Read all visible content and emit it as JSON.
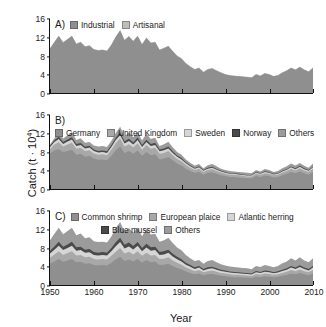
{
  "figure": {
    "ylabel_prefix": "Catch (t · 10",
    "ylabel_exponent": "4",
    "ylabel_suffix": ")",
    "xlabel": "Year"
  },
  "axes": {
    "yticks": [
      0,
      4,
      8,
      12,
      16
    ],
    "xticks": [
      1950,
      1960,
      1970,
      1980,
      1990,
      2000,
      2010
    ],
    "ylim": [
      0,
      16
    ],
    "xlim": [
      1950,
      2010
    ]
  },
  "colors": {
    "s1": "#8f8f8f",
    "s2": "#bdbdbd",
    "s3": "#d6d6d6",
    "s4": "#4a4a4a",
    "s5": "#a8a8a8",
    "axis": "#111111",
    "background": "#ffffff"
  },
  "panels": [
    {
      "id": "A",
      "label": "A)",
      "legend": [
        "Industrial",
        "Artisanal"
      ]
    },
    {
      "id": "B",
      "label": "B)",
      "legend": [
        "Germany",
        "United Kingdom",
        "Sweden",
        "Norway",
        "Others"
      ]
    },
    {
      "id": "C",
      "label": "C)",
      "legend": [
        "Common shrimp",
        "European plaice",
        "Atlantic herring",
        "Blue mussel",
        "Others"
      ]
    }
  ],
  "chart_data": [
    {
      "type": "area",
      "panel": "A",
      "title": "A)",
      "xlabel": "Year",
      "ylabel": "Catch (t · 10^4)",
      "xlim": [
        1950,
        2010
      ],
      "ylim": [
        0,
        16
      ],
      "grid": false,
      "legend_position": "top-left",
      "stacked": true,
      "x": [
        1950,
        1951,
        1952,
        1953,
        1954,
        1955,
        1956,
        1957,
        1958,
        1959,
        1960,
        1961,
        1962,
        1963,
        1964,
        1965,
        1966,
        1967,
        1968,
        1969,
        1970,
        1971,
        1972,
        1973,
        1974,
        1975,
        1976,
        1977,
        1978,
        1979,
        1980,
        1981,
        1982,
        1983,
        1984,
        1985,
        1986,
        1987,
        1988,
        1989,
        1990,
        1991,
        1992,
        1993,
        1994,
        1995,
        1996,
        1997,
        1998,
        1999,
        2000,
        2001,
        2002,
        2003,
        2004,
        2005,
        2006,
        2007,
        2008,
        2009,
        2010
      ],
      "series": [
        {
          "name": "Industrial",
          "values": [
            9.6,
            11.0,
            12.3,
            10.9,
            11.6,
            12.3,
            10.6,
            11.0,
            10.0,
            10.2,
            9.4,
            9.2,
            9.3,
            9.1,
            10.4,
            12.1,
            13.5,
            11.4,
            12.2,
            11.2,
            12.3,
            10.5,
            11.9,
            10.8,
            11.0,
            9.3,
            9.7,
            10.1,
            9.0,
            8.0,
            7.4,
            6.4,
            5.7,
            5.1,
            5.4,
            4.5,
            5.1,
            5.3,
            4.8,
            4.4,
            4.0,
            3.8,
            3.7,
            3.6,
            3.5,
            3.4,
            3.3,
            4.0,
            3.7,
            4.2,
            4.0,
            3.6,
            3.8,
            4.4,
            4.8,
            5.4,
            5.0,
            5.6,
            5.0,
            4.6,
            5.4
          ]
        },
        {
          "name": "Artisanal",
          "values": [
            0.1,
            0.1,
            0.1,
            0.1,
            0.1,
            0.1,
            0.1,
            0.1,
            0.1,
            0.1,
            0.1,
            0.1,
            0.1,
            0.1,
            0.1,
            0.1,
            0.1,
            0.1,
            0.1,
            0.1,
            0.1,
            0.1,
            0.1,
            0.1,
            0.1,
            0.1,
            0.1,
            0.1,
            0.1,
            0.1,
            0.1,
            0.1,
            0.1,
            0.1,
            0.1,
            0.1,
            0.1,
            0.1,
            0.1,
            0.1,
            0.1,
            0.1,
            0.1,
            0.1,
            0.1,
            0.1,
            0.1,
            0.1,
            0.1,
            0.1,
            0.1,
            0.1,
            0.1,
            0.1,
            0.1,
            0.1,
            0.1,
            0.1,
            0.1,
            0.1,
            0.1
          ]
        }
      ]
    },
    {
      "type": "area",
      "panel": "B",
      "title": "B)",
      "xlabel": "Year",
      "ylabel": "Catch (t · 10^4)",
      "xlim": [
        1950,
        2010
      ],
      "ylim": [
        0,
        16
      ],
      "grid": false,
      "legend_position": "top-left",
      "stacked": true,
      "x": [
        1950,
        1951,
        1952,
        1953,
        1954,
        1955,
        1956,
        1957,
        1958,
        1959,
        1960,
        1961,
        1962,
        1963,
        1964,
        1965,
        1966,
        1967,
        1968,
        1969,
        1970,
        1971,
        1972,
        1973,
        1974,
        1975,
        1976,
        1977,
        1978,
        1979,
        1980,
        1981,
        1982,
        1983,
        1984,
        1985,
        1986,
        1987,
        1988,
        1989,
        1990,
        1991,
        1992,
        1993,
        1994,
        1995,
        1996,
        1997,
        1998,
        1999,
        2000,
        2001,
        2002,
        2003,
        2004,
        2005,
        2006,
        2007,
        2008,
        2009,
        2010
      ],
      "series": [
        {
          "name": "Germany",
          "values": [
            7.6,
            8.4,
            8.6,
            8.0,
            8.2,
            8.5,
            7.4,
            7.6,
            7.0,
            7.2,
            6.6,
            6.3,
            6.4,
            6.2,
            7.2,
            8.4,
            9.2,
            7.8,
            8.2,
            7.6,
            8.3,
            7.2,
            8.0,
            7.3,
            7.5,
            6.4,
            6.6,
            6.9,
            6.2,
            5.5,
            5.1,
            4.4,
            3.9,
            3.5,
            3.7,
            3.1,
            3.5,
            3.6,
            3.3,
            3.0,
            2.8,
            2.6,
            2.6,
            2.5,
            2.4,
            2.3,
            2.3,
            2.8,
            2.6,
            2.9,
            2.8,
            2.5,
            2.6,
            3.0,
            3.3,
            3.7,
            3.4,
            3.8,
            3.4,
            3.1,
            3.7
          ]
        },
        {
          "name": "United Kingdom",
          "values": [
            1.0,
            1.2,
            1.5,
            1.2,
            1.4,
            1.5,
            1.3,
            1.3,
            1.2,
            1.2,
            1.1,
            1.1,
            1.1,
            1.1,
            1.3,
            1.5,
            1.7,
            1.4,
            1.5,
            1.4,
            1.6,
            1.3,
            1.5,
            1.4,
            1.4,
            1.2,
            1.2,
            1.3,
            1.1,
            1.0,
            0.9,
            0.8,
            0.7,
            0.6,
            0.7,
            0.6,
            0.6,
            0.7,
            0.6,
            0.55,
            0.5,
            0.48,
            0.47,
            0.45,
            0.44,
            0.42,
            0.42,
            0.5,
            0.47,
            0.53,
            0.5,
            0.45,
            0.48,
            0.55,
            0.6,
            0.68,
            0.62,
            0.7,
            0.62,
            0.57,
            0.68
          ]
        },
        {
          "name": "Sweden",
          "values": [
            0.45,
            0.55,
            0.7,
            0.55,
            0.65,
            0.7,
            0.6,
            0.6,
            0.55,
            0.55,
            0.5,
            0.5,
            0.5,
            0.5,
            0.6,
            0.7,
            0.8,
            0.65,
            0.7,
            0.62,
            0.72,
            0.6,
            0.68,
            0.62,
            0.64,
            0.55,
            0.56,
            0.58,
            0.5,
            0.45,
            0.4,
            0.35,
            0.3,
            0.27,
            0.3,
            0.25,
            0.28,
            0.3,
            0.26,
            0.24,
            0.22,
            0.21,
            0.2,
            0.2,
            0.19,
            0.18,
            0.18,
            0.22,
            0.2,
            0.23,
            0.22,
            0.2,
            0.21,
            0.24,
            0.26,
            0.3,
            0.27,
            0.3,
            0.27,
            0.25,
            0.3
          ]
        },
        {
          "name": "Norway",
          "values": [
            0.3,
            0.4,
            0.5,
            0.4,
            0.45,
            0.5,
            0.42,
            0.42,
            0.38,
            0.38,
            0.35,
            0.34,
            0.34,
            0.34,
            0.4,
            0.5,
            0.55,
            0.45,
            0.48,
            0.43,
            0.5,
            0.42,
            0.47,
            0.43,
            0.44,
            0.38,
            0.38,
            0.4,
            0.35,
            0.3,
            0.28,
            0.24,
            0.21,
            0.19,
            0.2,
            0.17,
            0.19,
            0.2,
            0.18,
            0.16,
            0.15,
            0.14,
            0.14,
            0.13,
            0.13,
            0.12,
            0.12,
            0.15,
            0.14,
            0.16,
            0.15,
            0.14,
            0.14,
            0.16,
            0.18,
            0.2,
            0.18,
            0.2,
            0.18,
            0.17,
            0.2
          ]
        },
        {
          "name": "Others",
          "values": [
            0.25,
            0.45,
            1.0,
            0.75,
            0.9,
            1.1,
            0.85,
            1.05,
            0.87,
            0.85,
            0.84,
            0.95,
            0.96,
            0.96,
            0.9,
            1.0,
            1.23,
            1.1,
            1.32,
            1.15,
            1.22,
            0.98,
            1.3,
            1.05,
            1.08,
            0.77,
            0.96,
            1.02,
            0.85,
            0.75,
            0.71,
            0.61,
            0.59,
            0.54,
            0.53,
            0.38,
            0.58,
            0.6,
            0.56,
            0.45,
            0.43,
            0.47,
            0.39,
            0.42,
            0.44,
            0.48,
            0.38,
            0.43,
            0.39,
            0.48,
            0.43,
            0.41,
            0.47,
            0.55,
            0.56,
            0.62,
            0.59,
            0.6,
            0.53,
            0.51,
            0.62
          ]
        }
      ]
    },
    {
      "type": "area",
      "panel": "C",
      "title": "C)",
      "xlabel": "Year",
      "ylabel": "Catch (t · 10^4)",
      "xlim": [
        1950,
        2010
      ],
      "ylim": [
        0,
        16
      ],
      "grid": false,
      "legend_position": "top-left",
      "stacked": true,
      "x": [
        1950,
        1951,
        1952,
        1953,
        1954,
        1955,
        1956,
        1957,
        1958,
        1959,
        1960,
        1961,
        1962,
        1963,
        1964,
        1965,
        1966,
        1967,
        1968,
        1969,
        1970,
        1971,
        1972,
        1973,
        1974,
        1975,
        1976,
        1977,
        1978,
        1979,
        1980,
        1981,
        1982,
        1983,
        1984,
        1985,
        1986,
        1987,
        1988,
        1989,
        1990,
        1991,
        1992,
        1993,
        1994,
        1995,
        1996,
        1997,
        1998,
        1999,
        2000,
        2001,
        2002,
        2003,
        2004,
        2005,
        2006,
        2007,
        2008,
        2009,
        2010
      ],
      "series": [
        {
          "name": "Common shrimp",
          "values": [
            4.6,
            5.1,
            5.6,
            5.0,
            5.3,
            5.6,
            4.9,
            5.0,
            4.6,
            4.7,
            4.3,
            4.2,
            4.3,
            4.2,
            4.8,
            5.5,
            6.1,
            5.2,
            5.5,
            5.1,
            5.6,
            4.8,
            5.4,
            4.9,
            5.0,
            4.3,
            4.4,
            4.6,
            4.1,
            3.7,
            3.4,
            2.9,
            2.6,
            2.3,
            2.5,
            2.1,
            2.3,
            2.4,
            2.2,
            2.0,
            1.9,
            1.8,
            1.7,
            1.7,
            1.6,
            1.6,
            1.5,
            1.8,
            1.7,
            1.9,
            1.8,
            1.7,
            1.8,
            2.0,
            2.2,
            2.5,
            2.3,
            2.6,
            2.3,
            2.1,
            2.5
          ]
        },
        {
          "name": "European plaice",
          "values": [
            1.3,
            1.5,
            1.7,
            1.5,
            1.6,
            1.7,
            1.5,
            1.5,
            1.4,
            1.4,
            1.3,
            1.3,
            1.3,
            1.3,
            1.5,
            1.7,
            1.9,
            1.6,
            1.7,
            1.5,
            1.7,
            1.5,
            1.6,
            1.5,
            1.5,
            1.3,
            1.3,
            1.4,
            1.2,
            1.1,
            1.0,
            0.9,
            0.8,
            0.7,
            0.75,
            0.63,
            0.7,
            0.72,
            0.66,
            0.6,
            0.56,
            0.53,
            0.52,
            0.5,
            0.49,
            0.47,
            0.46,
            0.56,
            0.52,
            0.58,
            0.56,
            0.5,
            0.53,
            0.6,
            0.66,
            0.75,
            0.69,
            0.77,
            0.69,
            0.63,
            0.75
          ]
        },
        {
          "name": "Atlantic herring",
          "values": [
            0.9,
            1.0,
            1.2,
            1.05,
            1.1,
            1.2,
            1.02,
            1.05,
            0.96,
            0.98,
            0.9,
            0.88,
            0.9,
            0.88,
            1.0,
            1.2,
            1.3,
            1.1,
            1.15,
            1.06,
            1.18,
            1.0,
            1.12,
            1.02,
            1.05,
            0.9,
            0.92,
            0.96,
            0.85,
            0.76,
            0.7,
            0.6,
            0.54,
            0.48,
            0.51,
            0.43,
            0.48,
            0.5,
            0.46,
            0.41,
            0.38,
            0.36,
            0.35,
            0.34,
            0.33,
            0.32,
            0.31,
            0.38,
            0.35,
            0.4,
            0.38,
            0.34,
            0.36,
            0.41,
            0.45,
            0.51,
            0.47,
            0.52,
            0.47,
            0.43,
            0.51
          ]
        },
        {
          "name": "Blue mussel",
          "values": [
            0.6,
            0.7,
            0.85,
            0.72,
            0.78,
            0.85,
            0.72,
            0.74,
            0.68,
            0.69,
            0.63,
            0.62,
            0.63,
            0.62,
            0.71,
            0.84,
            0.92,
            0.78,
            0.82,
            0.75,
            0.83,
            0.71,
            0.79,
            0.72,
            0.74,
            0.63,
            0.65,
            0.68,
            0.6,
            0.54,
            0.49,
            0.42,
            0.38,
            0.34,
            0.36,
            0.3,
            0.34,
            0.35,
            0.32,
            0.29,
            0.27,
            0.25,
            0.25,
            0.24,
            0.23,
            0.22,
            0.22,
            0.27,
            0.25,
            0.28,
            0.27,
            0.24,
            0.26,
            0.29,
            0.32,
            0.36,
            0.33,
            0.37,
            0.33,
            0.3,
            0.36
          ]
        },
        {
          "name": "Others",
          "values": [
            2.3,
            2.8,
            3.05,
            2.73,
            2.92,
            3.05,
            2.61,
            2.86,
            2.46,
            2.53,
            2.34,
            2.3,
            2.24,
            2.2,
            2.49,
            3.06,
            3.38,
            2.82,
            3.18,
            2.89,
            3.09,
            2.54,
            3.13,
            2.77,
            2.81,
            2.24,
            2.43,
            2.56,
            2.35,
            1.99,
            1.91,
            1.68,
            1.48,
            1.38,
            1.28,
            1.14,
            1.38,
            1.43,
            1.26,
            1.2,
            1.09,
            1.06,
            1.08,
            1.02,
            1.05,
            0.99,
            0.91,
            1.09,
            1.08,
            1.15,
            1.09,
            1.07,
            1.15,
            1.4,
            1.47,
            1.68,
            1.51,
            1.74,
            1.51,
            1.44,
            1.68
          ]
        }
      ]
    }
  ]
}
